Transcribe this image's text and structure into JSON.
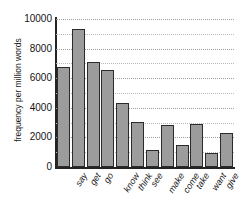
{
  "chart_data": {
    "type": "bar",
    "title": "",
    "xlabel": "",
    "ylabel": "frequency per million words",
    "categories": [
      "say",
      "get",
      "go",
      "know",
      "think",
      "see",
      "make",
      "come",
      "take",
      "want",
      "give",
      "mean"
    ],
    "values": [
      6750,
      9300,
      7100,
      6550,
      4300,
      3050,
      1150,
      2850,
      1500,
      2900,
      950,
      2300
    ],
    "ylim": [
      0,
      10000
    ],
    "ytick_labels": [
      "0",
      "2000",
      "4000",
      "6000",
      "8000",
      "10000"
    ],
    "ytick_values": [
      0,
      2000,
      4000,
      6000,
      8000,
      10000
    ],
    "gridlines": [
      1000,
      2000,
      3000,
      4000,
      5000,
      6000,
      7000,
      8000,
      9000,
      10000
    ],
    "grid": true,
    "legend": "none",
    "bar_color": "#9c9c9c",
    "bar_edge_color": "#2b2b2b",
    "axis_color": "#242424",
    "grid_color": "#b9b9b9"
  }
}
